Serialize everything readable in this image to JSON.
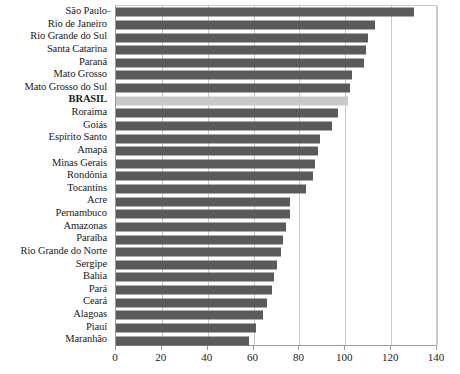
{
  "chart_data": {
    "type": "bar",
    "orientation": "horizontal",
    "title": "",
    "subtitle": "",
    "xlabel": "",
    "ylabel": "",
    "xlim": [
      0,
      140
    ],
    "xticks": [
      0,
      20,
      40,
      60,
      80,
      100,
      120,
      140
    ],
    "xtick_labels": [
      "0",
      "20",
      "40",
      "60",
      "80",
      "100",
      "120",
      "140"
    ],
    "grid": "vertical",
    "legend": "none",
    "categories": [
      "São Paulo",
      "Rio de Janeiro",
      "Rio Grande do Sul",
      "Santa Catarina",
      "Paraná",
      "Mato Grosso",
      "Mato Grosso do Sul",
      "BRASIL",
      "Roraima",
      "Goiás",
      "Espírito Santo",
      "Amapá",
      "Minas Gerais",
      "Rondônia",
      "Tocantins",
      "Acre",
      "Pernambuco",
      "Amazonas",
      "Paraíba",
      "Rio Grande do Norte",
      "Sergipe",
      "Bahia",
      "Pará",
      "Ceará",
      "Alagoas",
      "Piauí",
      "Maranhão"
    ],
    "values": [
      130,
      113,
      110,
      109,
      108,
      103,
      102,
      101,
      97,
      94,
      89,
      88,
      87,
      86,
      83,
      76,
      76,
      74,
      73,
      72,
      70,
      69,
      68,
      66,
      64,
      61,
      58
    ],
    "highlight_category": "BRASIL",
    "colors": {
      "bar": "#5a5a5a",
      "highlight_bar": "#c8c8c8",
      "gridline": "#c9c9c9",
      "axis": "#9a9a9a",
      "text": "#1a1a1a",
      "background": "#ffffff"
    }
  }
}
